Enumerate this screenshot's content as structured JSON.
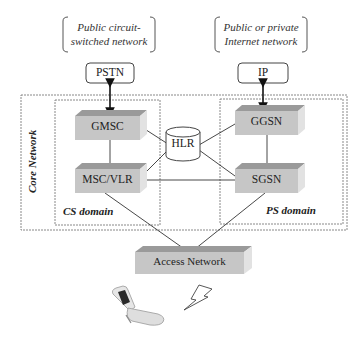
{
  "diagram": {
    "external_networks": [
      {
        "id": "pstn-network",
        "label_lines": [
          "Public circuit-",
          "switched network"
        ]
      },
      {
        "id": "internet-network",
        "label_lines": [
          "Public or private",
          "Internet network"
        ]
      }
    ],
    "gateways": {
      "pstn": "PSTN",
      "ip": "IP"
    },
    "core_network_label": "Core Network",
    "domains": {
      "cs": "CS domain",
      "ps": "PS domain"
    },
    "nodes": {
      "gmsc": "GMSC",
      "msc_vlr": "MSC/VLR",
      "hlr": "HLR",
      "ggsn": "GGSN",
      "sgsn": "SGSN",
      "access_network": "Access Network"
    },
    "connections": [
      [
        "PSTN",
        "GMSC",
        "bidirectional"
      ],
      [
        "IP",
        "GGSN",
        "bidirectional"
      ],
      [
        "GMSC",
        "MSC/VLR"
      ],
      [
        "GMSC",
        "HLR"
      ],
      [
        "MSC/VLR",
        "HLR"
      ],
      [
        "MSC/VLR",
        "SGSN"
      ],
      [
        "GGSN",
        "HLR"
      ],
      [
        "SGSN",
        "HLR"
      ],
      [
        "GGSN",
        "SGSN"
      ],
      [
        "MSC/VLR",
        "Access Network"
      ],
      [
        "SGSN",
        "Access Network"
      ]
    ],
    "colors": {
      "node_fill": "#c8c8c8",
      "node_top": "#9a9a9a",
      "node_side": "#dcdcdc",
      "line": "#333333",
      "dashed": "#777777"
    }
  }
}
